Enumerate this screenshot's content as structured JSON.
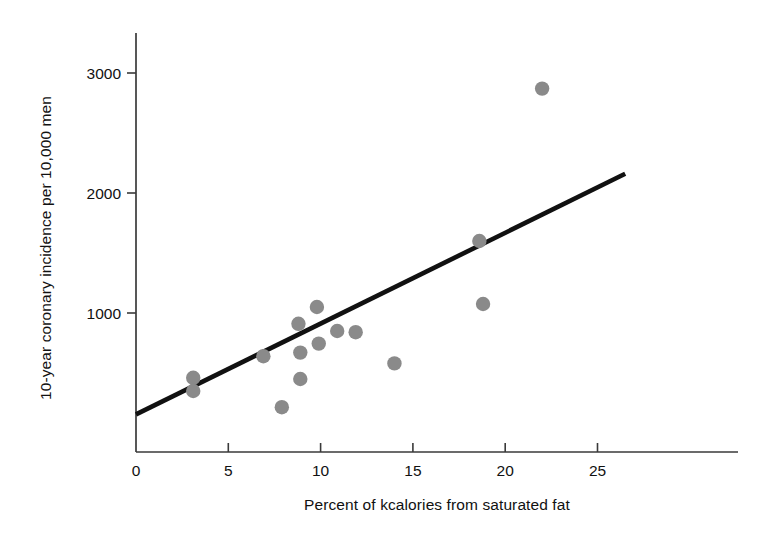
{
  "chart_data": {
    "type": "scatter",
    "title": "",
    "xlabel": "Percent of kcalories from saturated fat",
    "ylabel": "10-year coronary incidence per 10,000 men",
    "xlim": [
      0,
      26.5
    ],
    "ylim": [
      0,
      3300
    ],
    "xticks": [
      0,
      5,
      10,
      15,
      20,
      25
    ],
    "xticklabels": [
      "0",
      "5",
      "10",
      "15",
      "20",
      "25"
    ],
    "yticks": [
      1000,
      2000,
      3000
    ],
    "yticklabels": [
      "1000",
      "2000",
      "3000"
    ],
    "grid": false,
    "legend": null,
    "marker_color": "#8a8a8a",
    "line_color": "#111111",
    "axis_color": "#3a3a3a",
    "points": [
      {
        "x": 3.1,
        "y": 460
      },
      {
        "x": 3.1,
        "y": 350
      },
      {
        "x": 6.9,
        "y": 640
      },
      {
        "x": 7.9,
        "y": 215
      },
      {
        "x": 8.8,
        "y": 910
      },
      {
        "x": 8.9,
        "y": 670
      },
      {
        "x": 8.9,
        "y": 450
      },
      {
        "x": 9.8,
        "y": 1050
      },
      {
        "x": 9.9,
        "y": 745
      },
      {
        "x": 10.9,
        "y": 850
      },
      {
        "x": 11.9,
        "y": 840
      },
      {
        "x": 14.0,
        "y": 580
      },
      {
        "x": 18.6,
        "y": 1600
      },
      {
        "x": 18.8,
        "y": 1075
      },
      {
        "x": 22.0,
        "y": 2870
      }
    ],
    "fit_line": {
      "x_start": 0,
      "y_start": 155,
      "x_end": 26.5,
      "y_end": 2160
    }
  }
}
